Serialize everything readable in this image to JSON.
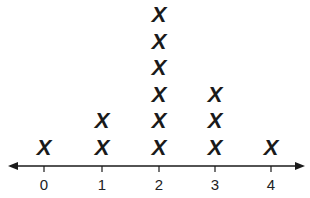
{
  "chart_data": {
    "type": "line-plot",
    "title": "",
    "xlabel": "",
    "ylabel": "",
    "marker": "X",
    "categories": [
      "0",
      "1",
      "2",
      "3",
      "4"
    ],
    "values": [
      1,
      2,
      6,
      3,
      1
    ],
    "xlim": [
      0,
      4
    ],
    "grid": false,
    "legend": null,
    "axis_arrows": true
  }
}
